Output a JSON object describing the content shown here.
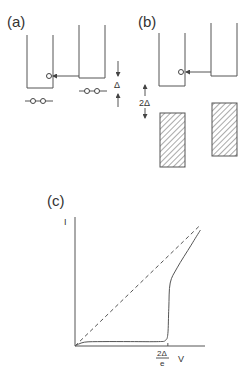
{
  "panels": {
    "a": {
      "label": "(a)",
      "gap_label": "Δ"
    },
    "b": {
      "label": "(b)",
      "gap_label": "2Δ"
    },
    "c": {
      "label": "(c)",
      "y_axis_label": "I",
      "x_axis_label": "V",
      "threshold_numerator": "2Δ",
      "threshold_denominator": "e"
    }
  },
  "chart_data": {
    "type": "line",
    "title": "(c)",
    "xlabel": "V",
    "ylabel": "I",
    "x_tick_labels": [
      "2Δ/e"
    ],
    "x_ticks": [
      2.0
    ],
    "xlim": [
      0,
      2.8
    ],
    "ylim": [
      0,
      1.0
    ],
    "grid": false,
    "series": [
      {
        "name": "ohmic (dashed)",
        "style": "dashed",
        "x": [
          0,
          2.7
        ],
        "y": [
          0,
          0.96
        ]
      },
      {
        "name": "superconducting tunneling (solid)",
        "style": "solid",
        "x": [
          0,
          0.2,
          0.6,
          1.2,
          1.8,
          1.95,
          2.0,
          2.02,
          2.05,
          2.2,
          2.5,
          2.7
        ],
        "y": [
          0,
          0.03,
          0.035,
          0.035,
          0.035,
          0.045,
          0.1,
          0.3,
          0.5,
          0.62,
          0.8,
          0.92
        ]
      }
    ]
  }
}
